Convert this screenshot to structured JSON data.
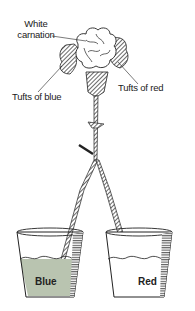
{
  "diagram": {
    "labels": {
      "white_carnation_line1": "White",
      "white_carnation_line2": "carnation",
      "tufts_red": "Tufts of red",
      "tufts_blue": "Tufts of blue"
    },
    "cups": [
      {
        "label": "Blue",
        "liquid_color": "#b9c4b0"
      },
      {
        "label": "Red",
        "liquid_color": "#ffffff"
      }
    ],
    "colors": {
      "ink": "#222222",
      "hatch": "#555555",
      "blue_liquid": "#b9c4b0",
      "background": "#ffffff"
    }
  }
}
